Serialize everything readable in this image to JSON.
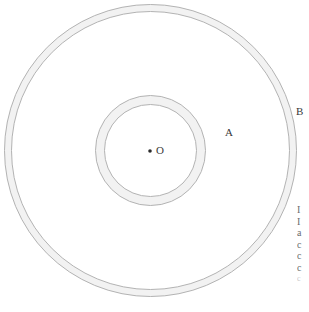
{
  "figure": {
    "type": "concentric-circles-diagram",
    "background_color": "#ffffff",
    "stroke_color": "#b3b3b3",
    "band_fill_color": "#f2f2f2",
    "center": {
      "x": 150.5,
      "y": 150.5
    },
    "circles": [
      {
        "name": "outer-ring-outer-circle",
        "radius": 146
      },
      {
        "name": "outer-ring-inner-circle",
        "radius": 139
      },
      {
        "name": "inner-ring-outer-circle",
        "radius": 55
      },
      {
        "name": "inner-ring-inner-circle",
        "radius": 46
      }
    ],
    "center_point": {
      "name": "center-point-O",
      "x": 150,
      "y": 151,
      "radius": 2
    }
  },
  "labels": {
    "center": "O",
    "inner_circle": "A",
    "outer_circle": "B"
  },
  "margin_text": {
    "lines": [
      "I",
      "I",
      "a",
      "c",
      "c",
      "c",
      "c"
    ]
  }
}
